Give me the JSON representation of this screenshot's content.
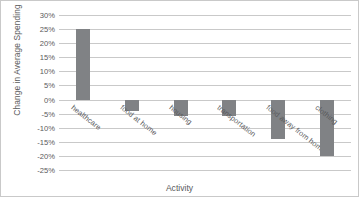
{
  "chart_data": {
    "type": "bar",
    "title": "",
    "xlabel": "Activity",
    "ylabel": "Change in Average Spending",
    "categories": [
      "healthcare",
      "food at home",
      "housing",
      "transportation",
      "food away from home",
      "clothing"
    ],
    "values": [
      25,
      -4,
      -6,
      -6,
      -14,
      -20
    ],
    "value_labels": [
      "25%",
      "-4%",
      "-6%",
      "-6%",
      "-14%",
      "-20%"
    ],
    "ylim": [
      -25,
      30
    ],
    "ytick_values": [
      30,
      25,
      20,
      15,
      10,
      5,
      0,
      -5,
      -10,
      -15,
      -20,
      -25
    ],
    "ytick_labels": [
      "30%",
      "25%",
      "20%",
      "15%",
      "10%",
      "5%",
      "0%",
      "-5%",
      "-10%",
      "-15%",
      "-20%",
      "-25%"
    ],
    "grid": true,
    "legend": false,
    "bar_color": "#808285",
    "grid_color": "#c9c9c9",
    "text_color": "#59595b"
  }
}
